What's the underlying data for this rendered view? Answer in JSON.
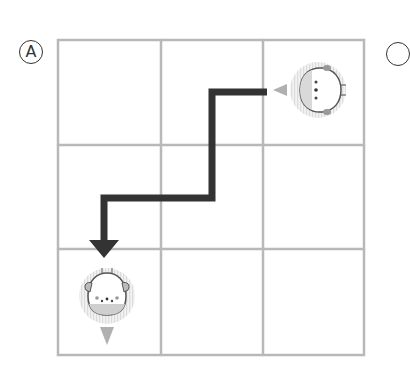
{
  "panel": {
    "label": "A",
    "next_label_partial": "",
    "grid": {
      "rows": 3,
      "cols": 3
    }
  },
  "characters": [
    {
      "name": "bird",
      "cell": [
        0,
        2
      ],
      "facing": "left"
    },
    {
      "name": "bear",
      "cell": [
        2,
        0
      ],
      "facing": "down"
    }
  ],
  "path": {
    "description": "Arrow from bird (row 1, col 3) left, down one row, left, then down into bear (row 3, col 1)",
    "color": "#333333"
  },
  "colors": {
    "grid_line": "#b8b8b8",
    "path": "#333333",
    "character_halo": "#e6e6e6",
    "pointer": "#b0b0b0"
  }
}
